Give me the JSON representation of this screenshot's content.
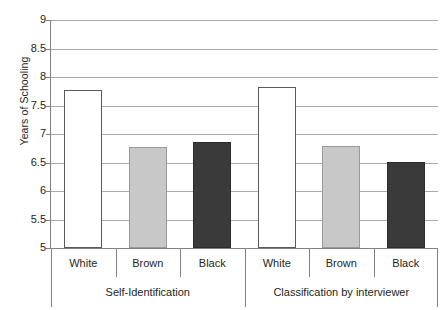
{
  "chart_data": {
    "type": "bar",
    "title": "",
    "xlabel": "",
    "ylabel": "Years of Schooling",
    "ylim": [
      5,
      9
    ],
    "ytick_labels": [
      "9",
      "8.5",
      "8",
      "7.5",
      "7",
      "6.5",
      "6",
      "5.5",
      "5"
    ],
    "ytick_values": [
      9,
      8.5,
      8,
      7.5,
      7,
      6.5,
      6,
      5.5,
      5
    ],
    "grid": true,
    "legend": "none",
    "categories": [
      "White",
      "Brown",
      "Black",
      "White",
      "Brown",
      "Black"
    ],
    "values": [
      7.75,
      6.75,
      6.84,
      7.81,
      6.78,
      6.49
    ],
    "bar_styles": [
      "white",
      "gray",
      "dark",
      "white",
      "gray",
      "dark"
    ],
    "groups": [
      {
        "label": "Self-Identification",
        "categories": [
          "White",
          "Brown",
          "Black"
        ],
        "values": [
          7.75,
          6.75,
          6.84
        ]
      },
      {
        "label": "Classification by interviewer",
        "categories": [
          "White",
          "Brown",
          "Black"
        ],
        "values": [
          7.81,
          6.78,
          6.49
        ]
      }
    ],
    "colors": {
      "white_bar_fill": "#ffffff",
      "white_bar_stroke": "#58595b",
      "gray_bar_fill": "#c8c8c8",
      "dark_bar_fill": "#3a3a3a",
      "gridline": "#a7a9ac",
      "axis": "#808285",
      "text": "#231f20"
    }
  }
}
